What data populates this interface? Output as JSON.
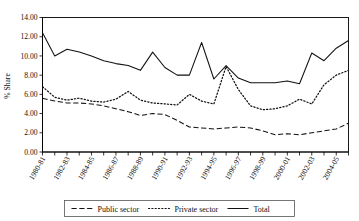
{
  "chart_data": {
    "type": "line",
    "title": "",
    "xlabel": "",
    "ylabel": "% Share",
    "ylim": [
      0.0,
      14.0
    ],
    "yticks": [
      0.0,
      2.0,
      4.0,
      6.0,
      8.0,
      10.0,
      12.0,
      14.0
    ],
    "ytick_labels": [
      "0.00",
      "2.00",
      "4.00",
      "6.00",
      "8.00",
      "10.00",
      "12.00",
      "14.00"
    ],
    "grid": false,
    "legend_position": "bottom",
    "categories": [
      "1980-81",
      "1981-82",
      "1982-83",
      "1983-84",
      "1984-85",
      "1985-86",
      "1986-87",
      "1987-88",
      "1988-89",
      "1989-90",
      "1990-91",
      "1991-92",
      "1992-93",
      "1993-94",
      "1994-95",
      "1995-96",
      "1996-97",
      "1997-98",
      "1998-99",
      "1999-2000",
      "2000-01",
      "2001-02",
      "2002-03",
      "2003-04",
      "2004-05",
      "2005-06"
    ],
    "xtick_labels_shown": [
      "1980-81",
      "1982-83",
      "1984-85",
      "1986-87",
      "1988-89",
      "1990-91",
      "1992-93",
      "1994-95",
      "1996-97",
      "1998-99",
      "2000-01",
      "2002-03",
      "2004-05"
    ],
    "series": [
      {
        "name": "Public sector",
        "style": "dashed",
        "values": [
          5.6,
          5.3,
          5.1,
          5.1,
          5.0,
          4.8,
          4.5,
          4.2,
          3.8,
          4.0,
          3.9,
          3.3,
          2.6,
          2.5,
          2.4,
          2.5,
          2.6,
          2.5,
          2.2,
          1.8,
          1.9,
          1.8,
          2.0,
          2.2,
          2.4,
          3.0
        ]
      },
      {
        "name": "Private sector",
        "style": "dotted",
        "values": [
          6.8,
          5.7,
          5.4,
          5.6,
          5.3,
          5.2,
          5.5,
          6.3,
          5.4,
          5.1,
          5.0,
          4.9,
          6.0,
          5.3,
          5.0,
          8.9,
          6.5,
          4.8,
          4.4,
          4.5,
          4.8,
          5.5,
          5.0,
          7.0,
          8.0,
          8.5
        ]
      },
      {
        "name": "Total",
        "style": "solid",
        "values": [
          12.4,
          10.0,
          10.7,
          10.4,
          10.0,
          9.5,
          9.2,
          9.0,
          8.5,
          10.4,
          8.8,
          8.0,
          8.0,
          11.4,
          7.6,
          9.0,
          7.7,
          7.2,
          7.2,
          7.2,
          7.4,
          7.1,
          10.3,
          9.5,
          10.8,
          11.6
        ]
      }
    ]
  },
  "legend": {
    "items": [
      {
        "label": "Public sector",
        "style": "dashed"
      },
      {
        "label": "Private sector",
        "style": "dotted"
      },
      {
        "label": "Total",
        "style": "solid"
      }
    ]
  }
}
